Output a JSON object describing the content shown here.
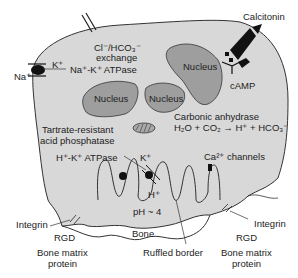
{
  "diagram": {
    "colors": {
      "cell_fill": "#d8d8d8",
      "nucleus_fill": "#9e9e9e",
      "outline": "#333333",
      "receptor": "#111111",
      "background": "#ffffff"
    },
    "labels": {
      "cl_hco3": "Cl⁻/HCO₃⁻",
      "exchange": "exchange",
      "k_plus": "K⁺",
      "na_plus": "Na⁺",
      "na_k_atpase": "Na⁺-K⁺ ATPase",
      "calcitonin": "Calcitonin",
      "camp": "cAMP",
      "nucleus_1": "Nucleus",
      "nucleus_2": "Nucleus",
      "nucleus_3": "Nucleus",
      "carbonic_anhydrase": "Carbonic anhydrase",
      "reaction": "H₂O + CO₂ → H⁺ + HCO₃⁻",
      "trap_1": "Tartrate-resistant",
      "trap_2": "acid phosphatase",
      "h_k_atpase": "H⁺-K⁺ ATPase",
      "k_plus_2": "K⁺",
      "h_plus": "H⁺",
      "ca_channels": "Ca²⁺ channels",
      "ph": "pH ~ 4",
      "bone": "Bone",
      "ruffled_border": "Ruffled border",
      "integrin_left": "Integrin",
      "rgd_left": "RGD",
      "bmp_left_1": "Bone matrix",
      "bmp_left_2": "protein",
      "integrin_right": "Integrin",
      "rgd_right": "RGD",
      "bmp_right_1": "Bone matrix",
      "bmp_right_2": "protein"
    }
  }
}
